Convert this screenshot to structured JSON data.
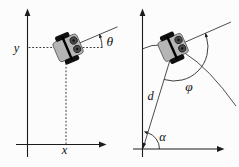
{
  "figure": {
    "background_color": "#fcfcfc",
    "axis_color": "#1c1c1c",
    "line_color": "#3a3a3a",
    "label_color": "#111111",
    "robot": {
      "body_color": "#b5b5b5",
      "body_border_color": "#5a5a5a",
      "wheel_color": "#101010",
      "axle_color": "#000000",
      "marker_fill": "#4a4a4a",
      "marker_ring": "#1c1c1c",
      "marker_dot": "#141414"
    },
    "left_panel": {
      "y_axis_label": "y",
      "x_axis_label": "x",
      "heading_angle_label": "θ"
    },
    "right_panel": {
      "distance_label": "d",
      "goal_angle_label": "φ",
      "bearing_angle_label": "α"
    }
  }
}
